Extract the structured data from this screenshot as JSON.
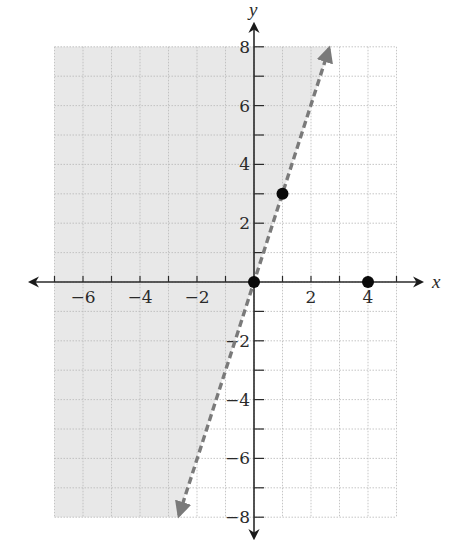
{
  "chart_data": {
    "type": "line",
    "title": "",
    "xlabel": "x",
    "ylabel": "y",
    "xlim": [
      -7,
      5
    ],
    "ylim": [
      -8,
      8
    ],
    "grid": true,
    "grid_step": 1,
    "x_tick_labels": [
      "-6",
      "-4",
      "-2",
      "2",
      "4"
    ],
    "y_tick_labels": [
      "8",
      "6",
      "4",
      "2",
      "-2",
      "-4",
      "-6",
      "-8"
    ],
    "series": [
      {
        "name": "boundary line y = 3x",
        "style": "dashed",
        "color": "#7a7a7a",
        "slope": 3,
        "intercept": 0,
        "x": [
          -2.667,
          2.667
        ],
        "y": [
          -8,
          8
        ],
        "arrows": "both"
      },
      {
        "name": "test points",
        "style": "scatter",
        "color": "#000000",
        "points": [
          [
            0,
            0
          ],
          [
            1,
            3
          ],
          [
            4,
            0
          ]
        ]
      }
    ],
    "shaded_region": {
      "description": "half-plane left of / above the line y = 3x",
      "inequality": "y > 3x",
      "color": "#e8e8e8"
    }
  },
  "labels": {
    "x_axis": "x",
    "y_axis": "y"
  },
  "colors": {
    "shade": "#e8e8e8",
    "grid": "#b8b8b8",
    "axis": "#2a2a2a",
    "line": "#7a7a7a",
    "point": "#0a0a0a"
  }
}
